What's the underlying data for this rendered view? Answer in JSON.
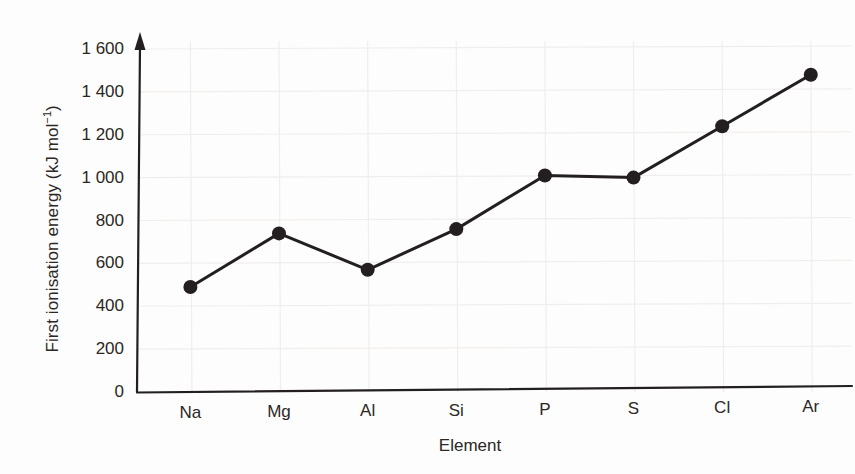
{
  "chart_data": {
    "type": "line",
    "title": "",
    "xlabel": "Element",
    "ylabel": "First ionisation energy (kJ mol⁻¹)",
    "ylabel_main": "First ionisation energy (kJ mol",
    "ylabel_sup": "−1",
    "ylabel_tail": ")",
    "categories": [
      "Na",
      "Mg",
      "Al",
      "Si",
      "P",
      "S",
      "Cl",
      "Ar"
    ],
    "values": [
      490,
      740,
      570,
      760,
      1010,
      1000,
      1240,
      1480
    ],
    "ylim": [
      0,
      1600
    ],
    "yticks": [
      0,
      200,
      400,
      600,
      800,
      1000,
      1200,
      1400,
      1600
    ],
    "ytick_labels": [
      "0",
      "200",
      "400",
      "600",
      "800",
      "1 000",
      "1 200",
      "1 400",
      "1 600"
    ],
    "grid": true,
    "legend": "none",
    "marker": "filled-circle",
    "line_color": "#231f20",
    "marker_color": "#231f20",
    "grid_color": "#f0eeec",
    "axis_color": "#231f20",
    "background_color": "#fdfdfd",
    "y_axis_arrow": true
  }
}
